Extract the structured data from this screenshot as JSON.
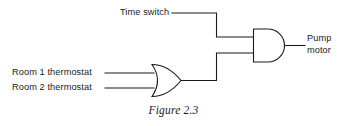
{
  "figure": {
    "caption": "Figure 2.3",
    "background_color": "#ffffff",
    "line_color": "#1a1a1a"
  },
  "inputs": [
    {
      "id": "time-switch",
      "label": "Time switch"
    },
    {
      "id": "room-1-thermostat",
      "label": "Room 1 thermostat"
    },
    {
      "id": "room-2-thermostat",
      "label": "Room 2 thermostat"
    }
  ],
  "output": {
    "id": "pump-motor",
    "label_line_1": "Pump",
    "label_line_2": "motor"
  },
  "gates": [
    {
      "id": "or-gate",
      "type": "OR",
      "inputs": [
        "Room 1 thermostat",
        "Room 2 thermostat"
      ],
      "output_to": "AND gate input 2"
    },
    {
      "id": "and-gate",
      "type": "AND",
      "inputs": [
        "Time switch",
        "OR gate output"
      ],
      "output_to": "Pump motor"
    }
  ]
}
